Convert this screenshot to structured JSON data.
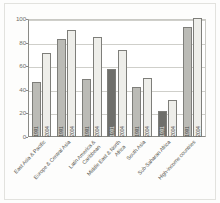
{
  "chart_data": {
    "type": "bar",
    "title": "",
    "subtitle": "",
    "xlabel": "",
    "ylabel": "",
    "ylim": [
      0,
      100
    ],
    "yticks": [
      0,
      20,
      40,
      60,
      80,
      100
    ],
    "grid": true,
    "legend_position": "none",
    "categories": [
      "East Asia & Pacific",
      "Europe & Central Asia",
      "Latin America & Caribbean",
      "Middle East & North Africa",
      "South Asia",
      "Sub-Saharan Africa",
      "High-income countries"
    ],
    "series": [
      {
        "name": "1991",
        "values": [
          47,
          83,
          49,
          58,
          42,
          22,
          93
        ]
      },
      {
        "name": "2004",
        "values": [
          71,
          91,
          85,
          74,
          50,
          31,
          101
        ]
      }
    ],
    "bar_labels": [
      [
        "1991",
        "2004"
      ],
      [
        "1991",
        "2004"
      ],
      [
        "1991",
        "2004"
      ],
      [
        "1991",
        "2004"
      ],
      [
        "1991",
        "2004"
      ],
      [
        "1991",
        "2004"
      ],
      [
        "1991",
        "2004"
      ]
    ],
    "bar_shades": [
      [
        "medium",
        "light"
      ],
      [
        "medium",
        "light"
      ],
      [
        "medium",
        "light"
      ],
      [
        "dark",
        "light"
      ],
      [
        "medium",
        "light"
      ],
      [
        "dark",
        "light"
      ],
      [
        "medium",
        "light"
      ]
    ],
    "colors": {
      "light": "#eeeeea",
      "medium": "#bbbbb6",
      "dark": "#6f6f6b",
      "bar_outline": "#7e7e7a",
      "gridline": "#cfcfca",
      "axis": "#8a8a86",
      "tick_text": "#6d6d69",
      "category_text": "#55554f",
      "background": "#ffffff"
    }
  }
}
